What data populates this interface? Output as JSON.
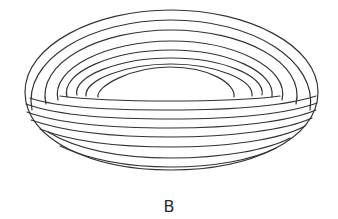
{
  "figure": {
    "label": "B",
    "stroke_color": "#333333",
    "background_color": "#ffffff"
  }
}
